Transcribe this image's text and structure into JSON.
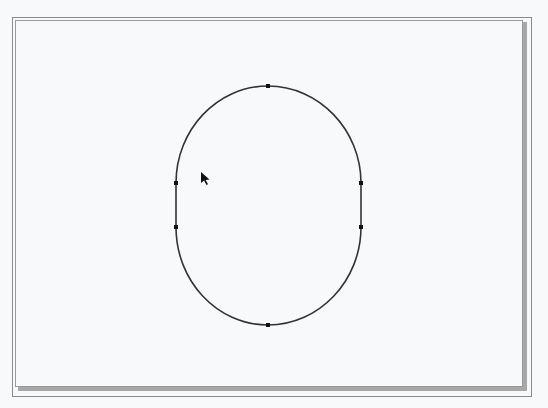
{
  "canvas": {
    "background": "#f7f9fb",
    "frame": {
      "outer": {
        "x": 12,
        "y": 17,
        "width": 519,
        "height": 379,
        "color": "#8a8a8a"
      },
      "inner": {
        "x": 15,
        "y": 20,
        "width": 509,
        "height": 369,
        "color": "#9a9a9a"
      },
      "shadow_color": "#a8a8a8"
    },
    "shape": {
      "type": "stadium-ellipse",
      "stroke": "#333333",
      "stroke_width": 1.6,
      "top": {
        "x": 268,
        "y": 86
      },
      "bottom": {
        "x": 268,
        "y": 325
      },
      "left_upper": {
        "x": 176,
        "y": 183
      },
      "left_lower": {
        "x": 176,
        "y": 227
      },
      "right_upper": {
        "x": 361,
        "y": 183
      },
      "right_lower": {
        "x": 361,
        "y": 227
      }
    },
    "nodes": [
      {
        "name": "top",
        "x": 268,
        "y": 86
      },
      {
        "name": "left-upper",
        "x": 176,
        "y": 183
      },
      {
        "name": "left-lower",
        "x": 176,
        "y": 227
      },
      {
        "name": "right-upper",
        "x": 361,
        "y": 183
      },
      {
        "name": "right-lower",
        "x": 361,
        "y": 227
      },
      {
        "name": "bottom",
        "x": 268,
        "y": 325
      }
    ],
    "cursor": {
      "icon": "arrow-cursor-icon",
      "x": 201,
      "y": 172
    }
  }
}
